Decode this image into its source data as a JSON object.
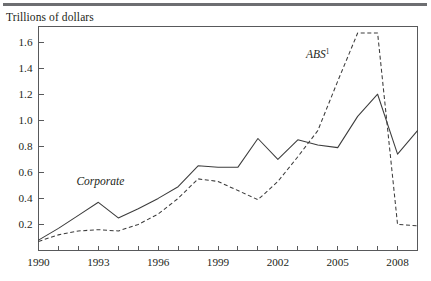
{
  "figure": {
    "units_label": "Trillions of dollars",
    "rule_color": "#6d6e71",
    "line_color": "#3c3c3c",
    "axis_color": "#58595b",
    "background": "#ffffff"
  },
  "chart_data": {
    "type": "line",
    "title": "",
    "subtitle": "",
    "xlabel": "",
    "ylabel": "Trillions of dollars",
    "xlim": [
      1990,
      2009
    ],
    "ylim": [
      0,
      1.72
    ],
    "yticks": [
      0.2,
      0.4,
      0.6,
      0.8,
      1.0,
      1.2,
      1.4,
      1.6
    ],
    "ytick_labels": [
      "0.2",
      "0.4",
      "0.6",
      "0.8",
      "1.0",
      "1.2",
      "1.4",
      "1.6"
    ],
    "xticks": [
      1990,
      1991,
      1992,
      1993,
      1994,
      1995,
      1996,
      1997,
      1998,
      1999,
      2000,
      2001,
      2002,
      2003,
      2004,
      2005,
      2006,
      2007,
      2008,
      2009
    ],
    "xtick_labels_shown": [
      "1990",
      "1993",
      "1996",
      "1999",
      "2002",
      "2005",
      "2008"
    ],
    "xtick_labels_shown_at": [
      1990,
      1993,
      1996,
      1999,
      2002,
      2005,
      2008
    ],
    "grid": false,
    "legend_position": "inline-annotation",
    "x": [
      1990,
      1991,
      1992,
      1993,
      1994,
      1995,
      1996,
      1997,
      1998,
      1999,
      2000,
      2001,
      2002,
      2003,
      2004,
      2005,
      2006,
      2007,
      2008,
      2009
    ],
    "series": [
      {
        "name": "Corporate",
        "style": "solid",
        "label_text": "Corporate",
        "label_superscript": "",
        "values": [
          0.08,
          0.17,
          0.27,
          0.37,
          0.25,
          0.32,
          0.4,
          0.49,
          0.65,
          0.64,
          0.64,
          0.86,
          0.7,
          0.85,
          0.81,
          0.79,
          1.03,
          1.2,
          0.74,
          0.92
        ]
      },
      {
        "name": "ABS",
        "style": "dashed",
        "label_text": "ABS",
        "label_superscript": "1",
        "values": [
          0.07,
          0.12,
          0.15,
          0.16,
          0.15,
          0.2,
          0.28,
          0.4,
          0.55,
          0.53,
          0.46,
          0.39,
          0.53,
          0.72,
          0.92,
          1.3,
          1.67,
          1.67,
          0.2,
          0.19
        ]
      }
    ],
    "annotations": [
      {
        "text": "Corporate",
        "superscript": "",
        "x": 1993.1,
        "y": 0.5,
        "style": "italic"
      },
      {
        "text": "ABS",
        "superscript": "1",
        "x": 2004.0,
        "y": 1.48,
        "style": "italic"
      }
    ]
  }
}
